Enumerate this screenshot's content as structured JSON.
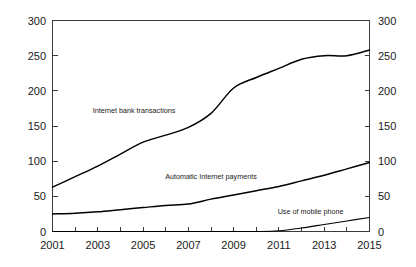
{
  "chart_data": {
    "type": "line",
    "title": "",
    "subtitle": "",
    "xlabel": "",
    "ylabel": "",
    "xlim": [
      2001,
      2015
    ],
    "ylim": [
      0,
      300
    ],
    "grid": false,
    "legend_position": "inline-annotations",
    "x": [
      2001,
      2002,
      2003,
      2004,
      2005,
      2006,
      2007,
      2008,
      2009,
      2010,
      2011,
      2012,
      2013,
      2014,
      2015
    ],
    "x_tick_labels": [
      "2001",
      "2003",
      "2005",
      "2007",
      "2009",
      "2011",
      "2013",
      "2015"
    ],
    "x_tick_values": [
      2001,
      2003,
      2005,
      2007,
      2009,
      2011,
      2013,
      2015
    ],
    "y_tick_labels_left": [
      "0",
      "50",
      "100",
      "150",
      "200",
      "250",
      "300"
    ],
    "y_tick_labels_right": [
      "0",
      "50",
      "100",
      "150",
      "200",
      "250",
      "300"
    ],
    "y_tick_values": [
      0,
      50,
      100,
      150,
      200,
      250,
      300
    ],
    "series": [
      {
        "name": "Internet bank transactions",
        "values": [
          63,
          78,
          93,
          110,
          127,
          137,
          148,
          168,
          204,
          219,
          232,
          245,
          250,
          250,
          258
        ],
        "label_x": 2004.6,
        "label_y": 168
      },
      {
        "name": "Automatic Internet payments",
        "values": [
          25,
          26,
          28,
          31,
          34,
          37,
          39,
          46,
          52,
          58,
          64,
          72,
          80,
          89,
          98
        ],
        "label_x": 2008.0,
        "label_y": 74
      },
      {
        "name": "Use of mobile phone",
        "values": [
          0,
          0,
          0,
          0,
          0,
          0,
          0,
          0,
          0,
          0,
          1,
          5,
          10,
          15,
          20
        ],
        "label_x": 2012.4,
        "label_y": 25
      }
    ]
  },
  "axis": {
    "y_left": {
      "t0": "0",
      "t50": "50",
      "t100": "100",
      "t150": "150",
      "t200": "200",
      "t250": "250",
      "t300": "300"
    },
    "y_right": {
      "t0": "0",
      "t50": "50",
      "t100": "100",
      "t150": "150",
      "t200": "200",
      "t250": "250",
      "t300": "300"
    },
    "x": {
      "t2001": "2001",
      "t2003": "2003",
      "t2005": "2005",
      "t2007": "2007",
      "t2009": "2009",
      "t2011": "2011",
      "t2013": "2013",
      "t2015": "2015"
    }
  },
  "annotations": {
    "series1": "Internet bank transactions",
    "series2": "Automatic Internet payments",
    "series3": "Use of mobile phone"
  },
  "colors": {
    "background": "#ffffff",
    "line": "#000000",
    "axis": "#3a3a3a",
    "text": "#1a1a1a"
  }
}
